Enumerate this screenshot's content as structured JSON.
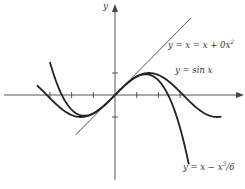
{
  "chart_data": {
    "type": "line",
    "title": "",
    "xlabel": "",
    "ylabel": "y",
    "xlim": [
      -5.3,
      5.9
    ],
    "ylim": [
      -3.9,
      4.1
    ],
    "grid": false,
    "legend": "inline labels",
    "x_ticks": [
      -3,
      -2,
      -1,
      1,
      2,
      3
    ],
    "y_ticks": [
      -1,
      1
    ],
    "series": [
      {
        "name": "y = sin x",
        "function": "sin(x)",
        "x_range": [
          -3.6,
          4.9
        ],
        "stroke": "#222222",
        "width": 1.8
      },
      {
        "name": "y = x - x^3/6",
        "function": "x - x^3/6",
        "x_range": [
          -3.0,
          3.4
        ],
        "stroke": "#222222",
        "width": 1.8
      },
      {
        "name": "y = x = x + 0x^2",
        "function": "x",
        "x_range": [
          -1.8,
          3.5
        ],
        "stroke": "#333333",
        "width": 1.0
      }
    ]
  },
  "labels": {
    "y_axis": "y",
    "line": "y = x = x + 0x",
    "line_sup": "2",
    "sin": "y = sin x",
    "cubic": "y = x − x",
    "cubic_sup": "3",
    "cubic_tail": "/6"
  },
  "colors": {
    "curve": "#222222",
    "axis": "#444444",
    "text": "#333333",
    "background": "#ffffff"
  }
}
